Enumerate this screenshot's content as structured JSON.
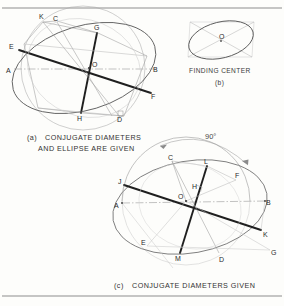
{
  "page": {
    "background": "#fdfdfb",
    "ink": "#2b2b2b",
    "light_ink": "#9a9a9a",
    "faint_ink": "#c3c3c3",
    "width": 284,
    "height": 306,
    "top_rule": true,
    "bottom_rule": true
  },
  "figures": [
    {
      "id": "a",
      "caption_marker": "(a)",
      "caption_line1": "CONJUGATE DIAMETERS",
      "caption_line2": "AND ELLIPSE ARE GIVEN",
      "description": "Ellipse with given conjugate diameters; circumscribed construction circle and chords locate the true major and minor axes.",
      "points": [
        {
          "label": "C",
          "x": 55,
          "y": 18
        },
        {
          "label": "K",
          "x": 41,
          "y": 17
        },
        {
          "label": "G",
          "x": 96,
          "y": 28
        },
        {
          "label": "E",
          "x": 13,
          "y": 47
        },
        {
          "label": "A",
          "x": 10,
          "y": 70
        },
        {
          "label": "O",
          "x": 89,
          "y": 69
        },
        {
          "label": "B",
          "x": 155,
          "y": 70
        },
        {
          "label": "F",
          "x": 152,
          "y": 97
        },
        {
          "label": "H",
          "x": 79,
          "y": 117
        },
        {
          "label": "D",
          "x": 114,
          "y": 121
        }
      ]
    },
    {
      "id": "b",
      "caption_marker": "(b)",
      "caption_line1": "FINDING CENTER",
      "caption_line2": "",
      "description": "Ellipse inscribed in a parallelogram; the diagonals of the circumscribing parallelogram cross at the ellipse center O.",
      "points": [
        {
          "label": "O",
          "x": 221,
          "y": 39
        }
      ]
    },
    {
      "id": "c",
      "caption_marker": "(c)",
      "caption_line1": "CONJUGATE DIAMETERS GIVEN",
      "caption_line2": "",
      "description": "Only the conjugate diameters are given; a semicircle and a 90 degree revolution locate the major and minor axes of the ellipse.",
      "angle_label": "90°",
      "points": [
        {
          "label": "C",
          "x": 170,
          "y": 158
        },
        {
          "label": "L",
          "x": 206,
          "y": 162
        },
        {
          "label": "F",
          "x": 237,
          "y": 176
        },
        {
          "label": "J",
          "x": 121,
          "y": 182
        },
        {
          "label": "H",
          "x": 194,
          "y": 187
        },
        {
          "label": "O",
          "x": 180,
          "y": 201
        },
        {
          "label": "A",
          "x": 119,
          "y": 206
        },
        {
          "label": "B",
          "x": 267,
          "y": 203
        },
        {
          "label": "K",
          "x": 263,
          "y": 234
        },
        {
          "label": "E",
          "x": 144,
          "y": 242
        },
        {
          "label": "G",
          "x": 272,
          "y": 252
        },
        {
          "label": "M",
          "x": 178,
          "y": 257
        },
        {
          "label": "D",
          "x": 222,
          "y": 258
        }
      ]
    }
  ]
}
